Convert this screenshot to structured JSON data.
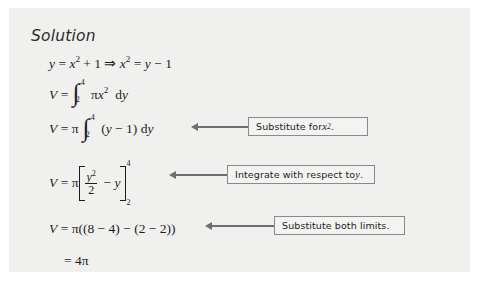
{
  "page": {
    "background_color": "#ffffff",
    "card_color": "#f0f0ee",
    "text_color": "#1c1c1c",
    "rule_color": "#6e6e6e"
  },
  "heading": {
    "label": "Solution"
  },
  "steps": [
    {
      "id": "step-1",
      "text": "y = x² + 1 ⇒ x² = y − 1",
      "lhs": "y",
      "relation": "=",
      "rhs": "x² + 1 ⇒ x² = y − 1"
    },
    {
      "id": "step-2",
      "text": "V = ∫₂⁴ πx² dy",
      "lhs": "V",
      "integral_lower": "2",
      "integral_upper": "4",
      "integrand": "πx²",
      "differential": "dy"
    },
    {
      "id": "step-3",
      "text": "V = π ∫₂⁴ (y − 1) dy",
      "lhs": "V",
      "coefficient": "π",
      "integral_lower": "2",
      "integral_upper": "4",
      "integrand": "(y − 1)",
      "differential": "dy"
    },
    {
      "id": "step-4",
      "text": "V = π [ y²/2 − y ]₂⁴",
      "lhs": "V",
      "coefficient": "π",
      "numerator": "y²",
      "denominator": "2",
      "remainder": "− y",
      "limit_lower": "2",
      "limit_upper": "4"
    },
    {
      "id": "step-5",
      "text": "V = π((8 − 4) − (2 − 2))",
      "lhs": "V",
      "expression": "π((8 − 4) − (2 − 2))"
    },
    {
      "id": "step-6",
      "text": "= 4π",
      "expression": "4π"
    }
  ],
  "callouts": [
    {
      "id": "callout-substitute-x-squared",
      "text_before": "Substitute for ",
      "variable": "x",
      "exponent": "2",
      "text_after": ".",
      "full_text": "Substitute for x²."
    },
    {
      "id": "callout-integrate-wrt-y",
      "text_before": "Integrate with respect to ",
      "variable": "y",
      "exponent": "",
      "text_after": ".",
      "full_text": "Integrate with respect to y."
    },
    {
      "id": "callout-substitute-both-limits",
      "text_before": "Substitute both limits.",
      "variable": "",
      "exponent": "",
      "text_after": "",
      "full_text": "Substitute both limits."
    }
  ]
}
